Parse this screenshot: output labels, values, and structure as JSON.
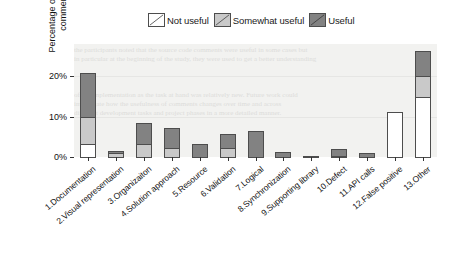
{
  "chart_data": {
    "type": "bar",
    "subtype": "stacked-bar",
    "title": "",
    "xlabel": "",
    "ylabel": "Percentage of overall comments",
    "ylim": [
      0,
      28
    ],
    "yticks": [
      "0%",
      "10%",
      "20%"
    ],
    "ytick_values": [
      0,
      10,
      20
    ],
    "grid": true,
    "legend_position": "top-center",
    "categories": [
      "1.Documentation",
      "2.Visual representation",
      "3.Organizaiton",
      "4.Solution approach",
      "5.Resource",
      "6.Validation",
      "7.Logical",
      "8.Synchronization",
      "9.Supporting library",
      "10.Defect",
      "11.API calls",
      "12.False positive",
      "13.Other"
    ],
    "series": [
      {
        "name": "Not useful",
        "color": "#ffffff",
        "values": [
          3.5,
          0,
          0,
          0,
          0,
          0,
          0,
          0,
          0,
          0,
          0,
          11.5,
          15.0
        ]
      },
      {
        "name": "Somewhat useful",
        "color": "#c9c9c9",
        "values": [
          7.0,
          1.2,
          3.5,
          2.6,
          0,
          2.6,
          0,
          0,
          0,
          0.6,
          0,
          0,
          5.5
        ]
      },
      {
        "name": "Useful",
        "color": "#828282",
        "values": [
          11.0,
          0.8,
          5.5,
          5.1,
          3.5,
          3.6,
          6.8,
          1.4,
          0.2,
          1.9,
          1.3,
          0,
          6.5
        ]
      }
    ],
    "totals": [
      21.5,
      2.0,
      9.0,
      7.7,
      3.5,
      6.2,
      6.8,
      1.4,
      0.2,
      2.5,
      1.3,
      11.5,
      27.0
    ]
  },
  "legend": {
    "entries": [
      {
        "label": "Not useful",
        "swatch": "hatch-white-swatch"
      },
      {
        "label": "Somewhat useful",
        "swatch": "hatch-lightgray-swatch"
      },
      {
        "label": "Useful",
        "swatch": "hatch-darkgray-swatch"
      }
    ]
  },
  "watermark": {
    "line1": "the participants noted that the source code comments were useful in some cases but",
    "line2": "in particular at the beginning of the study, they were used to get a better understanding",
    "line3": "of the implementation as the task at hand was relatively new. Future work could",
    "line4": "investigate how the usefulness of comments changes over time and across",
    "line5": "different development tasks and project phases in a more detailed manner."
  }
}
